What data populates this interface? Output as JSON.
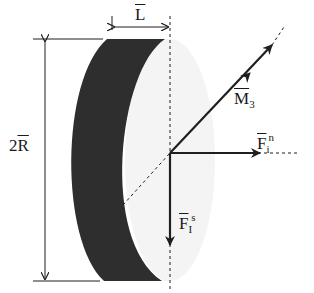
{
  "diagram": {
    "title": "",
    "labels": {
      "length": "L",
      "diameter_coef": "2",
      "diameter_var": "R",
      "moment": "M",
      "moment_sub": "3",
      "force_n": "F",
      "force_n_sub": "i",
      "force_n_sup": "n",
      "force_s": "F",
      "force_s_sub": "I",
      "force_s_sup": "s"
    },
    "colors": {
      "body": "#2e2e2e",
      "face": "#f3f3f3",
      "lines": "#1f1f1f"
    }
  }
}
